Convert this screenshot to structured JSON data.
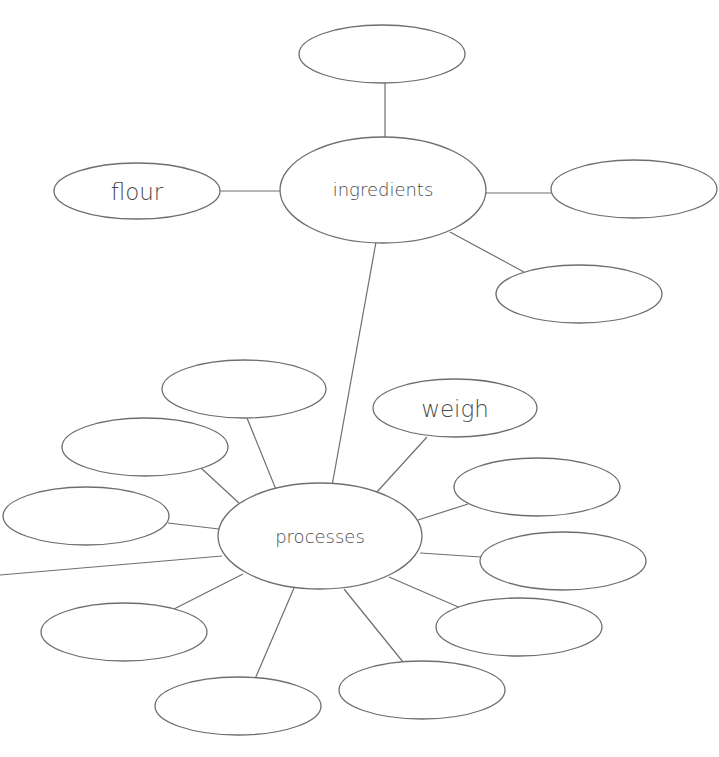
{
  "diagram": {
    "type": "mind-map",
    "colors": {
      "stroke": "#6e6e6e",
      "text": "#4a4a4a",
      "background": "#ffffff"
    },
    "hubs": {
      "ingredients": {
        "label": "ingredients"
      },
      "processes": {
        "label": "processes"
      }
    },
    "ingredient_nodes": [
      {
        "label": ""
      },
      {
        "label": "flour"
      },
      {
        "label": ""
      },
      {
        "label": ""
      }
    ],
    "process_nodes": [
      {
        "label": "weigh"
      },
      {
        "label": ""
      },
      {
        "label": ""
      },
      {
        "label": ""
      },
      {
        "label": ""
      },
      {
        "label": ""
      },
      {
        "label": ""
      },
      {
        "label": ""
      },
      {
        "label": ""
      },
      {
        "label": ""
      }
    ]
  }
}
